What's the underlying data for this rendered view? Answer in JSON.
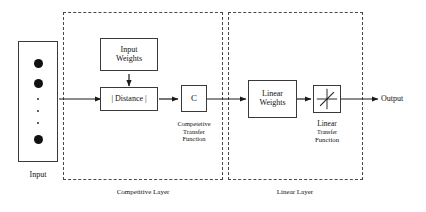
{
  "diagram": {
    "ink_color": "#111111",
    "box_border_color": "#3a3a3a",
    "dashed_border_color": "#4a4a4a"
  },
  "input": {
    "label": "Input",
    "neurons": [
      "neuron",
      "neuron",
      "ellipsis",
      "ellipsis",
      "ellipsis",
      "neuron"
    ]
  },
  "competitive_layer": {
    "label": "Competitive Layer",
    "input_weights": {
      "line1": "Input",
      "line2": "Weights"
    },
    "distance": {
      "text": "| Distance |"
    },
    "compet_block": {
      "symbol": "C"
    },
    "transfer_caption": {
      "line1": "Competetive",
      "line2": "Transfer",
      "line3": "Function"
    }
  },
  "linear_layer": {
    "label": "Linear Layer",
    "linear_weights": {
      "line1": "Linear",
      "line2": "Weights"
    },
    "transfer_block": {
      "icon": "linear-transfer-icon"
    },
    "transfer_caption": {
      "line1": "Linear",
      "line2": "Transfer",
      "line3": "Function"
    }
  },
  "output": {
    "label": "Output"
  }
}
